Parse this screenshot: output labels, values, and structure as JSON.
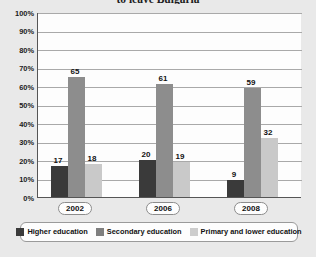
{
  "chart_data": {
    "type": "bar",
    "title": "to leave Bulgaria",
    "xlabel": "",
    "ylabel": "",
    "ylim": [
      0,
      100
    ],
    "ytick_labels": [
      "100%",
      "90%",
      "80%",
      "70%",
      "60%",
      "50%",
      "40%",
      "30%",
      "20%",
      "10%",
      "0%"
    ],
    "ytick_values": [
      100,
      90,
      80,
      70,
      60,
      50,
      40,
      30,
      20,
      10,
      0
    ],
    "grid": true,
    "legend_position": "bottom",
    "categories": [
      "2002",
      "2006",
      "2008"
    ],
    "series": [
      {
        "name": "Higher education",
        "color": "#3a3a3a",
        "values": [
          17,
          20,
          9
        ]
      },
      {
        "name": "Secondary education",
        "color": "#8d8d8d",
        "values": [
          65,
          61,
          59
        ]
      },
      {
        "name": "Primary and lower education",
        "color": "#c9c9c9",
        "values": [
          18,
          19,
          32
        ]
      }
    ]
  }
}
